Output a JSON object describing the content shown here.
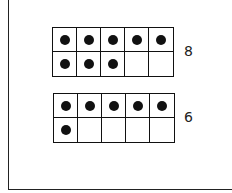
{
  "frames": [
    {
      "count": 8,
      "label": "8",
      "filled": [
        1,
        1,
        1,
        1,
        1,
        1,
        1,
        1,
        0,
        0
      ]
    },
    {
      "count": 6,
      "label": "6",
      "filled": [
        1,
        1,
        1,
        1,
        1,
        1,
        0,
        0,
        0,
        0
      ]
    }
  ]
}
